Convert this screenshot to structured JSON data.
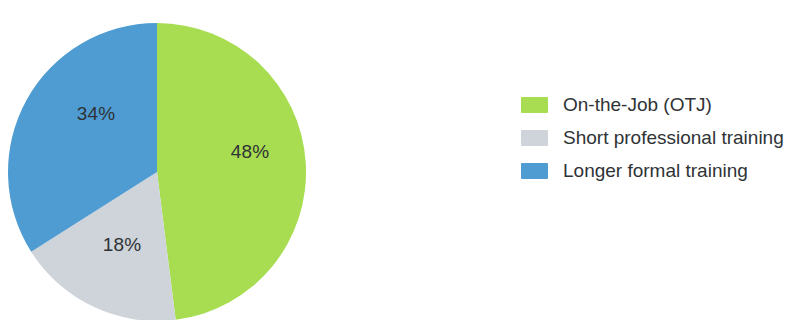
{
  "chart_data": {
    "type": "pie",
    "title": "",
    "subtitle": "",
    "xlabel": "",
    "ylabel": "",
    "grid": false,
    "legend_position": "right",
    "start_angle_deg": 0,
    "direction": "clockwise",
    "center": {
      "x": 157,
      "y": 172
    },
    "radius": 149,
    "categories": [
      "On-the-Job (OTJ)",
      "Short professional training",
      "Longer formal training"
    ],
    "values": [
      48,
      18,
      34
    ],
    "value_unit": "%",
    "data_labels": [
      "48%",
      "18%",
      "34%"
    ],
    "colors": [
      "#a8dd52",
      "#ced4d9",
      "#4e9cd2"
    ],
    "slices": [
      {
        "label": "On-the-Job (OTJ)",
        "value": 48,
        "display": "48%",
        "color": "#a8dd52",
        "start_deg": 0,
        "sweep_deg": 172.8,
        "label_x": 250,
        "label_y": 158
      },
      {
        "label": "Short professional training",
        "value": 18,
        "display": "18%",
        "color": "#ced4d9",
        "start_deg": 172.8,
        "sweep_deg": 64.8,
        "label_x": 122,
        "label_y": 251
      },
      {
        "label": "Longer formal training",
        "value": 34,
        "display": "34%",
        "color": "#4e9cd2",
        "start_deg": 237.6,
        "sweep_deg": 122.4,
        "label_x": 96,
        "label_y": 120
      }
    ]
  },
  "legend": {
    "items": [
      {
        "label": "On-the-Job (OTJ)",
        "color": "#a8dd52",
        "swatch_name": "legend-swatch-on-the-job"
      },
      {
        "label": "Short professional training",
        "color": "#ced4d9",
        "swatch_name": "legend-swatch-short-professional-training"
      },
      {
        "label": "Longer formal training",
        "color": "#4e9cd2",
        "swatch_name": "legend-swatch-longer-formal-training"
      }
    ]
  },
  "theme": {
    "background": "#ffffff",
    "text_color": "#2f3336",
    "green": "#a8dd52",
    "gray": "#ced4d9",
    "blue": "#4e9cd2"
  }
}
